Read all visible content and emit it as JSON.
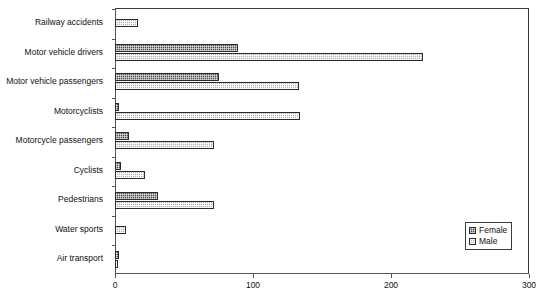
{
  "chart_data": {
    "type": "bar",
    "orientation": "horizontal",
    "title": "",
    "subtitle": "",
    "xlabel": "",
    "ylabel": "",
    "xlim": [
      0,
      300
    ],
    "xticks": [
      0,
      100,
      200,
      300
    ],
    "xtick_labels": [
      "0",
      "100",
      "200",
      "300"
    ],
    "grid": false,
    "legend_position": "bottom-right",
    "categories": [
      "Railway accidents",
      "Motor vehicle drivers",
      "Motor vehicle passengers",
      "Motorcyclists",
      "Motorcycle passengers",
      "Cyclists",
      "Pedestrians",
      "Water sports",
      "Air transport"
    ],
    "series": [
      {
        "name": "Female",
        "values": [
          0,
          89,
          75,
          3,
          10,
          4,
          31,
          0,
          3
        ]
      },
      {
        "name": "Male",
        "values": [
          17,
          223,
          133,
          134,
          72,
          22,
          72,
          8,
          2
        ]
      }
    ]
  },
  "legend": {
    "items": [
      {
        "label": "Female",
        "swatch": "female-hatch-swatch"
      },
      {
        "label": "Male",
        "swatch": "male-hatch-swatch"
      }
    ]
  }
}
